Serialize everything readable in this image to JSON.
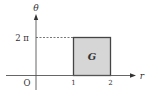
{
  "diagram": {
    "axes": {
      "x_label": "r",
      "y_label": "θ",
      "origin_label": "O"
    },
    "ticks": {
      "x": [
        "1",
        "2"
      ],
      "y": [
        "2 π"
      ]
    },
    "region": {
      "label": "G",
      "r_range": [
        1,
        2
      ],
      "theta_range": [
        0,
        "2π"
      ],
      "fill": "#d6d6d6",
      "stroke": "#444444"
    }
  }
}
